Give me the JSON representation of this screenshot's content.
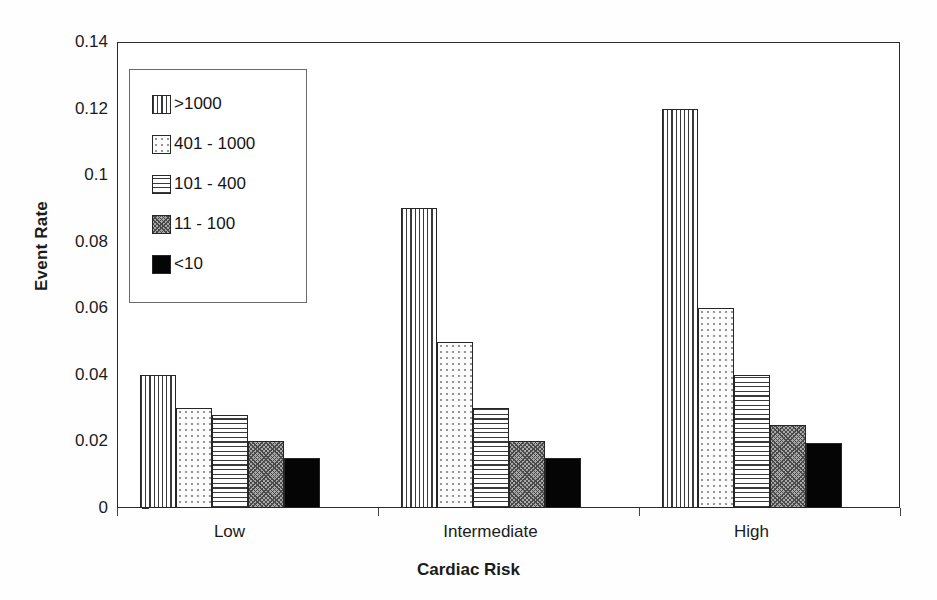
{
  "chart_data": {
    "type": "bar",
    "title": "",
    "subtitle": "",
    "xlabel": "Cardiac Risk",
    "ylabel": "Event Rate",
    "categories": [
      "Low",
      "Intermediate",
      "High"
    ],
    "ylim": [
      0,
      0.14
    ],
    "yticks": [
      "0.14",
      "0.12",
      "0.1",
      "0.08",
      "0.06",
      "0.04",
      "0.02",
      "0"
    ],
    "ytick_values": [
      0.14,
      0.12,
      0.1,
      0.08,
      0.06,
      0.04,
      0.02,
      0
    ],
    "grid": false,
    "legend_position": "upper-left-inside",
    "series": [
      {
        "name": ">1000",
        "pattern": "vertical-lines",
        "values": [
          0.04,
          0.09,
          0.12
        ]
      },
      {
        "name": "401 - 1000",
        "pattern": "light-dots",
        "values": [
          0.03,
          0.05,
          0.06
        ]
      },
      {
        "name": "101 - 400",
        "pattern": "horizontal-lines",
        "values": [
          0.028,
          0.03,
          0.04
        ]
      },
      {
        "name": "11 - 100",
        "pattern": "diagonal-hatch",
        "values": [
          0.02,
          0.02,
          0.025
        ]
      },
      {
        "name": "<10",
        "pattern": "solid-black",
        "values": [
          0.015,
          0.015,
          0.0195
        ]
      }
    ]
  },
  "colors": {
    "axis": "#2b2b2b",
    "text": "#1b1b1b",
    "plot_background": "#ffffff",
    "page_background": "#fefefe",
    "bar_outline": "#262626",
    "legend_border": "#6b6b6b"
  }
}
